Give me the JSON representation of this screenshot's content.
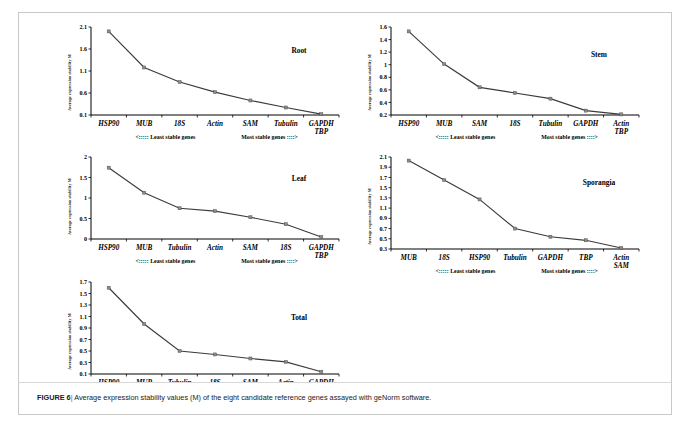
{
  "caption": {
    "label": "FIGURE 6",
    "separator": "|",
    "text": "Average expression stability values (M) of the eight candidate reference genes assayed with geNorm software."
  },
  "axis_label": "Average expression stability M",
  "annotations": {
    "least": "<::::: Least stable genes",
    "most": "Most stable genes ::::>"
  },
  "chart_data": [
    {
      "type": "line",
      "title": "Root",
      "xlabel": "",
      "ylabel": "Average expression stability M",
      "categories": [
        "HSP90",
        "MUB",
        "18S",
        "Actin",
        "SAM",
        "Tubulin",
        "GAPDH\nTBP"
      ],
      "category_lines": [
        [
          "HSP90"
        ],
        [
          "MUB"
        ],
        [
          "18S"
        ],
        [
          "Actin"
        ],
        [
          "SAM"
        ],
        [
          "Tubulin"
        ],
        [
          "GAPDH",
          "TBP"
        ]
      ],
      "values": [
        2.0,
        1.18,
        0.85,
        0.62,
        0.43,
        0.27,
        0.12
      ],
      "yticks": [
        0.1,
        0.6,
        1.1,
        1.6,
        2.1
      ],
      "ylim": [
        0.1,
        2.1
      ],
      "grid": false,
      "legend": "none"
    },
    {
      "type": "line",
      "title": "Stem",
      "xlabel": "",
      "ylabel": "Average expression stability M",
      "categories": [
        "HSP90",
        "MUB",
        "SAM",
        "18S",
        "Tubulin",
        "GAPDH",
        "Actin\nTBP"
      ],
      "category_lines": [
        [
          "HSP90"
        ],
        [
          "MUB"
        ],
        [
          "SAM"
        ],
        [
          "18S"
        ],
        [
          "Tubulin"
        ],
        [
          "GAPDH"
        ],
        [
          "Actin",
          "TBP"
        ]
      ],
      "values": [
        1.53,
        1.01,
        0.64,
        0.55,
        0.46,
        0.27,
        0.21
      ],
      "yticks": [
        0.2,
        0.4,
        0.6,
        0.8,
        1.0,
        1.2,
        1.4,
        1.6
      ],
      "ytick_labels": [
        "0.2",
        "0.4",
        "0.6",
        "0.8",
        "1",
        "1.2",
        "1.4",
        "1.6"
      ],
      "ylim": [
        0.2,
        1.6
      ],
      "grid": false,
      "legend": "none"
    },
    {
      "type": "line",
      "title": "Leaf",
      "xlabel": "",
      "ylabel": "Average expression stability M",
      "categories": [
        "HSP90",
        "MUB",
        "Tubulin",
        "Actin",
        "SAM",
        "18S",
        "GAPDH\nTBP"
      ],
      "category_lines": [
        [
          "HSP90"
        ],
        [
          "MUB"
        ],
        [
          "Tubulin"
        ],
        [
          "Actin"
        ],
        [
          "SAM"
        ],
        [
          "18S"
        ],
        [
          "GAPDH",
          "TBP"
        ]
      ],
      "values": [
        1.74,
        1.13,
        0.75,
        0.68,
        0.53,
        0.36,
        0.05
      ],
      "yticks": [
        0,
        0.5,
        1.0,
        1.5,
        2.0
      ],
      "ytick_labels": [
        "0",
        "0.5",
        "1",
        "1.5",
        "2"
      ],
      "ylim": [
        0,
        2.0
      ],
      "grid": false,
      "legend": "none"
    },
    {
      "type": "line",
      "title": "Sporangia",
      "xlabel": "",
      "ylabel": "Average expression stability M",
      "categories": [
        "MUB",
        "18S",
        "HSP90",
        "Tubulin",
        "GAPDH",
        "TBP",
        "Actin\nSAM"
      ],
      "category_lines": [
        [
          "MUB"
        ],
        [
          "18S"
        ],
        [
          "HSP90"
        ],
        [
          "Tubulin"
        ],
        [
          "GAPDH"
        ],
        [
          "TBP"
        ],
        [
          "Actin",
          "SAM"
        ]
      ],
      "values": [
        2.03,
        1.65,
        1.27,
        0.7,
        0.54,
        0.47,
        0.32
      ],
      "yticks": [
        0.3,
        0.5,
        0.7,
        0.9,
        1.1,
        1.3,
        1.5,
        1.7,
        1.9,
        2.1
      ],
      "ylim": [
        0.3,
        2.1
      ],
      "grid": false,
      "legend": "none"
    },
    {
      "type": "line",
      "title": "Total",
      "xlabel": "",
      "ylabel": "Average expression stability M",
      "categories": [
        "HSP90",
        "MUB",
        "Tubulin",
        "18S",
        "SAM",
        "Actin",
        "GAPDH\nTBP"
      ],
      "category_lines": [
        [
          "HSP90"
        ],
        [
          "MUB"
        ],
        [
          "Tubulin"
        ],
        [
          "18S"
        ],
        [
          "SAM"
        ],
        [
          "Actin"
        ],
        [
          "GAPDH",
          "TBP"
        ]
      ],
      "values": [
        1.6,
        0.97,
        0.5,
        0.44,
        0.37,
        0.31,
        0.14
      ],
      "yticks": [
        0.1,
        0.3,
        0.5,
        0.7,
        0.9,
        1.1,
        1.3,
        1.5,
        1.7
      ],
      "ylim": [
        0.1,
        1.7
      ],
      "grid": false,
      "legend": "none"
    }
  ]
}
